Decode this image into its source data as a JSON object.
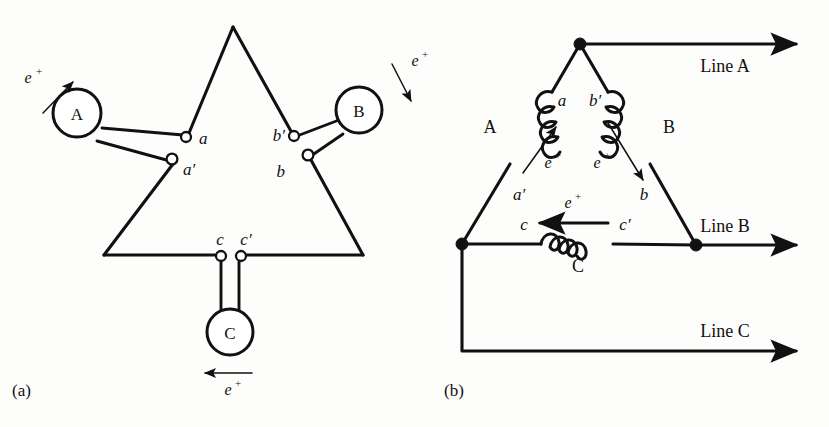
{
  "figure": {
    "panels": [
      {
        "id": "a",
        "label": "(a)"
      },
      {
        "id": "b",
        "label": "(b)"
      }
    ]
  },
  "panel_a": {
    "caption": "(a)",
    "coils": [
      {
        "name": "coil-a",
        "label": "A"
      },
      {
        "name": "coil-b",
        "label": "B"
      },
      {
        "name": "coil-c",
        "label": "C"
      }
    ],
    "terminals": [
      {
        "name": "terminal-a",
        "label": "a"
      },
      {
        "name": "terminal-a-prime",
        "label": "a′"
      },
      {
        "name": "terminal-b",
        "label": "b"
      },
      {
        "name": "terminal-b-prime",
        "label": "b′"
      },
      {
        "name": "terminal-c",
        "label": "c"
      },
      {
        "name": "terminal-c-prime",
        "label": "c′"
      }
    ],
    "emf_arrows": [
      {
        "name": "emf-arrow-a",
        "label": "e",
        "superscript": "+",
        "direction": "up-right"
      },
      {
        "name": "emf-arrow-b",
        "label": "e",
        "superscript": "+",
        "direction": "down-right"
      },
      {
        "name": "emf-arrow-c",
        "label": "e",
        "superscript": "+",
        "direction": "left"
      }
    ]
  },
  "panel_b": {
    "caption": "(b)",
    "windings": [
      {
        "name": "winding-a",
        "label": "A"
      },
      {
        "name": "winding-b",
        "label": "B"
      },
      {
        "name": "winding-c",
        "label": "C"
      }
    ],
    "terminals": [
      {
        "name": "terminal-a",
        "label": "a"
      },
      {
        "name": "terminal-a-prime",
        "label": "a′"
      },
      {
        "name": "terminal-b",
        "label": "b"
      },
      {
        "name": "terminal-b-prime",
        "label": "b′"
      },
      {
        "name": "terminal-c",
        "label": "c"
      },
      {
        "name": "terminal-c-prime",
        "label": "c′"
      }
    ],
    "emf_arrows": [
      {
        "name": "emf-arrow-a",
        "label": "e",
        "superscript": "+",
        "direction": "up-right"
      },
      {
        "name": "emf-arrow-b",
        "label": "e",
        "superscript": "+",
        "direction": "down-right"
      },
      {
        "name": "emf-arrow-c",
        "label": "e",
        "superscript": "+",
        "direction": "left"
      }
    ],
    "lines": [
      {
        "name": "line-a",
        "label": "Line A"
      },
      {
        "name": "line-b",
        "label": "Line B"
      },
      {
        "name": "line-c",
        "label": "Line C"
      }
    ]
  },
  "colors": {
    "ink": "#111111",
    "paper": "#fdfdfc"
  }
}
